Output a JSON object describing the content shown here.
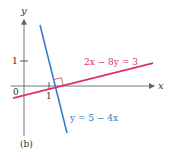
{
  "chart_data": {
    "type": "line",
    "title": "",
    "panel_label": "(b)",
    "xlabel": "x",
    "ylabel": "y",
    "origin_label": "0",
    "x_ticks": [
      {
        "value": 1,
        "label": "1"
      }
    ],
    "y_ticks": [
      {
        "value": 1,
        "label": "1"
      }
    ],
    "xlim": [
      -0.45,
      5.2
    ],
    "ylim": [
      -2.0,
      2.65
    ],
    "grid": false,
    "series": [
      {
        "name": "y = 5 - 4x",
        "label": "y = 5 − 4x",
        "color": "#3a78c4",
        "x": [
          0.64,
          1.72
        ],
        "y": [
          2.44,
          -1.88
        ]
      },
      {
        "name": "2x - 8y = 3",
        "label": "2x − 8y = 3",
        "color": "#d8336a",
        "x": [
          -0.44,
          5.16
        ],
        "y": [
          -0.485,
          0.915
        ]
      }
    ],
    "annotations": [
      {
        "type": "right-angle",
        "at": {
          "x": 1.21,
          "y": -0.07
        }
      }
    ]
  }
}
